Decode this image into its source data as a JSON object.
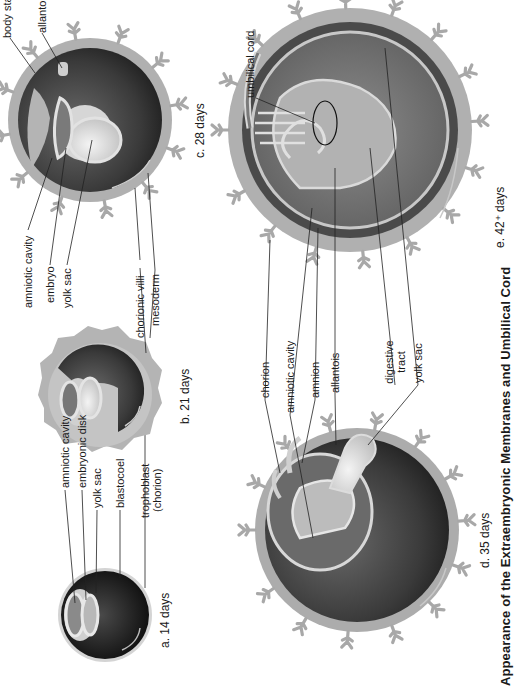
{
  "figure": {
    "title": "Appearance of the Extraembryonic Membranes and Umbilical Cord",
    "colors": {
      "villi": "#a8a8a8",
      "chorion": "#9a9a9a",
      "cavity_dark": "#3c3c3c",
      "amnion_light": "#d8d8d8",
      "yolk": "#e6e6e6"
    },
    "panels": [
      {
        "id": "a",
        "caption": "a.  14 days",
        "labels": [
          "amniotic cavity",
          "embryonic disk",
          "yolk sac",
          "blastocoel",
          "trophoblast",
          "(chorion)"
        ]
      },
      {
        "id": "b",
        "caption": "b.  21 days",
        "labels": []
      },
      {
        "id": "c",
        "caption": "c.  28 days",
        "labels": [
          "body stalk",
          "allantois",
          "amniotic cavity",
          "embryo",
          "yolk sac",
          "chorionic villi",
          "mesoderm"
        ]
      },
      {
        "id": "d",
        "caption": "d.  35 days",
        "labels": [
          "chorion",
          "amniotic cavity",
          "amnion",
          "allantois",
          "digestive",
          "tract",
          "yolk sac"
        ]
      },
      {
        "id": "e",
        "caption": "e.  42⁺ days",
        "labels": [
          "umbilical cord"
        ]
      }
    ]
  }
}
